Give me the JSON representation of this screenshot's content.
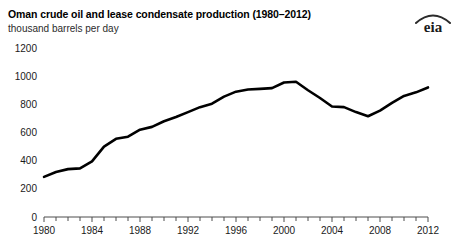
{
  "header": {
    "title": "Oman crude oil and lease condensate production (1980–2012)",
    "subtitle": "thousand barrels per day",
    "logo_text": "eia",
    "logo_name": "eia-logo"
  },
  "chart_data": {
    "type": "line",
    "title": "Oman crude oil and lease condensate production (1980–2012)",
    "subtitle": "thousand barrels per day",
    "xlabel": "",
    "ylabel": "thousand barrels per day",
    "xlim": [
      1980,
      2012
    ],
    "ylim": [
      0,
      1200
    ],
    "ytick_labels": [
      "0",
      "200",
      "400",
      "600",
      "800",
      "1000",
      "1200"
    ],
    "yticks": [
      0,
      200,
      400,
      600,
      800,
      1000,
      1200
    ],
    "xtick_labels": [
      "1980",
      "1984",
      "1988",
      "1992",
      "1996",
      "2000",
      "2004",
      "2008",
      "2012"
    ],
    "xticks_major": [
      1980,
      1984,
      1988,
      1992,
      1996,
      2000,
      2004,
      2008,
      2012
    ],
    "xticks_minor_step": 1,
    "grid": false,
    "legend": false,
    "line_color": "#000000",
    "x": [
      1980,
      1981,
      1982,
      1983,
      1984,
      1985,
      1986,
      1987,
      1988,
      1989,
      1990,
      1991,
      1992,
      1993,
      1994,
      1995,
      1996,
      1997,
      1998,
      1999,
      2000,
      2001,
      2002,
      2003,
      2004,
      2005,
      2006,
      2007,
      2008,
      2009,
      2010,
      2011,
      2012
    ],
    "series": [
      {
        "name": "Oman crude oil and lease condensate production",
        "values": [
          285,
          320,
          340,
          345,
          395,
          500,
          555,
          570,
          620,
          640,
          680,
          710,
          745,
          780,
          805,
          855,
          890,
          905,
          910,
          915,
          955,
          960,
          900,
          845,
          785,
          780,
          745,
          715,
          755,
          810,
          860,
          885,
          920
        ]
      }
    ]
  }
}
